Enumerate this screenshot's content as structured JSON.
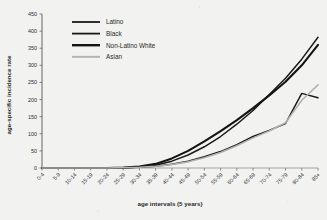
{
  "chart_data": {
    "type": "line",
    "title": "",
    "xlabel": "age intervals (5 years)",
    "ylabel": "age-specific incidence rate",
    "categories": [
      "0-4",
      "5-9",
      "10-14",
      "15-19",
      "20-24",
      "25-29",
      "30-34",
      "35-39",
      "40-44",
      "45-49",
      "50-54",
      "55-59",
      "60-64",
      "65-69",
      "70-74",
      "75-79",
      "80-84",
      "85+"
    ],
    "ylim": [
      0,
      450
    ],
    "yticks": [
      0,
      50,
      100,
      150,
      200,
      250,
      300,
      350,
      400,
      450
    ],
    "grid": false,
    "legend_position": "top-left",
    "series": [
      {
        "name": "Latino",
        "color": "#1a1a1a",
        "width": 1.5,
        "values": [
          0,
          0,
          0,
          0,
          0,
          1,
          2,
          5,
          11,
          20,
          33,
          48,
          68,
          92,
          110,
          130,
          218,
          205
        ]
      },
      {
        "name": "Black",
        "color": "#1a1a1a",
        "width": 1.5,
        "values": [
          0,
          0,
          0,
          0,
          0,
          1,
          3,
          8,
          20,
          38,
          62,
          92,
          128,
          168,
          215,
          262,
          318,
          382
        ]
      },
      {
        "name": "Non-Latino White",
        "color": "#141414",
        "width": 2.1,
        "values": [
          0,
          0,
          0,
          0,
          0,
          1,
          4,
          12,
          28,
          50,
          78,
          108,
          140,
          175,
          212,
          252,
          300,
          360
        ]
      },
      {
        "name": "Asian",
        "color": "#b2b2b2",
        "width": 1.6,
        "values": [
          0,
          0,
          0,
          0,
          0,
          1,
          2,
          5,
          10,
          18,
          30,
          45,
          65,
          88,
          108,
          132,
          198,
          243
        ]
      }
    ]
  },
  "axes": {
    "y_title": "age-specific incidence rate",
    "x_title": "age intervals (5 years)"
  },
  "legend": {
    "items": [
      {
        "label": "Latino"
      },
      {
        "label": "Black"
      },
      {
        "label": "Non-Latino White"
      },
      {
        "label": "Asian"
      }
    ]
  }
}
